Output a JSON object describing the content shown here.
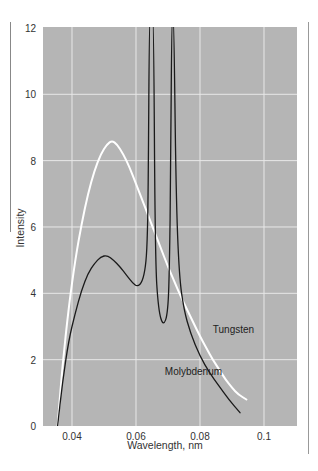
{
  "chart_data": {
    "type": "line",
    "title": "",
    "xlabel": "Wavelength, nm",
    "ylabel": "Intensity",
    "xlim": [
      0.031,
      0.11
    ],
    "ylim": [
      0,
      12
    ],
    "grid": true,
    "legend": "inline labels",
    "x_ticks": [
      "0.04",
      "0.06",
      "0.08",
      "0.1"
    ],
    "y_ticks": [
      "0",
      "2",
      "4",
      "6",
      "8",
      "10",
      "12"
    ],
    "series": [
      {
        "name": "Tungsten",
        "color": "#ffffff",
        "x": [
          0.0355,
          0.037,
          0.039,
          0.041,
          0.043,
          0.045,
          0.047,
          0.049,
          0.051,
          0.0525,
          0.054,
          0.056,
          0.058,
          0.06,
          0.062,
          0.064,
          0.066,
          0.068,
          0.07,
          0.072,
          0.074,
          0.076,
          0.078,
          0.08,
          0.082,
          0.084,
          0.086,
          0.088,
          0.09,
          0.092,
          0.0945
        ],
        "values": [
          0.0,
          1.8,
          3.6,
          5.0,
          6.1,
          7.0,
          7.7,
          8.2,
          8.5,
          8.6,
          8.5,
          8.2,
          7.8,
          7.3,
          6.8,
          6.3,
          5.8,
          5.3,
          4.8,
          4.35,
          3.9,
          3.5,
          3.1,
          2.7,
          2.35,
          2.0,
          1.7,
          1.4,
          1.15,
          0.95,
          0.8
        ]
      },
      {
        "name": "Molybdenum",
        "color": "#1a1a1a",
        "x": [
          0.0355,
          0.037,
          0.039,
          0.041,
          0.043,
          0.045,
          0.047,
          0.049,
          0.051,
          0.053,
          0.055,
          0.057,
          0.059,
          0.0605,
          0.062,
          0.063,
          0.0635,
          0.0638,
          0.0642,
          0.0648,
          0.0655,
          0.066,
          0.067,
          0.0685,
          0.07,
          0.0705,
          0.0708,
          0.0712,
          0.0718,
          0.0725,
          0.0735,
          0.075,
          0.077,
          0.08,
          0.083,
          0.086,
          0.089,
          0.0925
        ],
        "values": [
          0.0,
          1.3,
          2.6,
          3.4,
          4.1,
          4.6,
          4.9,
          5.1,
          5.15,
          5.0,
          4.8,
          4.55,
          4.3,
          4.2,
          4.35,
          4.8,
          5.5,
          7.0,
          12.5,
          12.5,
          12.5,
          5.0,
          3.5,
          3.0,
          3.4,
          5.0,
          7.5,
          12.5,
          12.5,
          7.0,
          4.5,
          3.5,
          2.8,
          2.1,
          1.6,
          1.2,
          0.8,
          0.4
        ]
      }
    ],
    "annotations": [
      {
        "text": "Tungsten",
        "x": 0.084,
        "y": 2.8
      },
      {
        "text": "Molybdenum",
        "x": 0.069,
        "y": 1.55
      }
    ],
    "plot_background": "#b5b5b5",
    "gridline_color": "#e8e8e8"
  }
}
